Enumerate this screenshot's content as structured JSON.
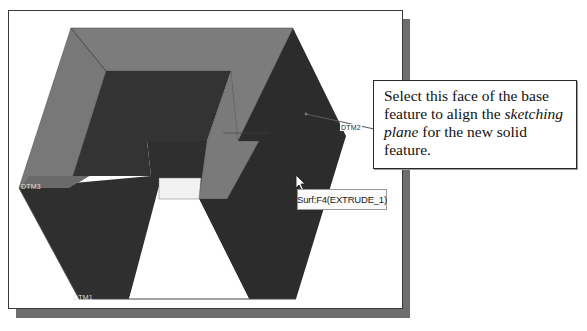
{
  "figure": {
    "type": "CAD viewport screenshot with callout annotation",
    "colors": {
      "top_face": "#7a7a7a",
      "dark_face": "#2e2e2e",
      "inner_face": "#3a3a3a",
      "frame_border": "#3a3a3a",
      "shadow": "#6e6e6e",
      "background": "#ffffff"
    }
  },
  "viewport": {
    "datums": [
      {
        "label": "DTM2"
      },
      {
        "label": "DTM3"
      },
      {
        "label": "DTM1"
      }
    ],
    "tooltip": {
      "text": "Surf:F4(EXTRUDE_1)"
    },
    "cursor": {
      "icon": "arrow-pointer-icon"
    }
  },
  "callout": {
    "text_part1": "Select this face of the base feature to align the ",
    "text_italic1": "sketching plane",
    "text_part2": " for the new solid feature."
  }
}
